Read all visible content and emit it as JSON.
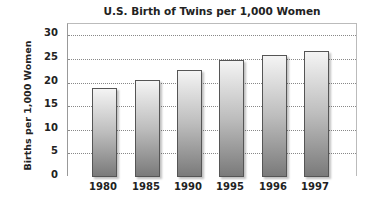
{
  "chart_data": {
    "type": "bar",
    "title": "U.S. Birth of Twins per 1,000 Women",
    "xlabel": "",
    "ylabel": "Births per 1,000 Women",
    "categories": [
      "1980",
      "1985",
      "1990",
      "1995",
      "1996",
      "1997"
    ],
    "values": [
      18.9,
      20.5,
      22.6,
      24.8,
      25.8,
      26.8
    ],
    "ylim": [
      0,
      32
    ],
    "yticks": [
      "0",
      "5",
      "10",
      "15",
      "20",
      "25",
      "30"
    ],
    "grid": true,
    "legend": null
  }
}
